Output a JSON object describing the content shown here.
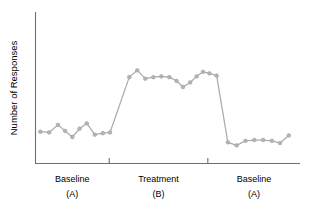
{
  "chart_data": {
    "type": "line",
    "title": "",
    "subtitle": "",
    "xlabel": "",
    "ylabel": "Number of Responses",
    "design": "ABA reversal (single-case) design",
    "grid": false,
    "legend": false,
    "legend_position": "none",
    "axis_ticks_shown": false,
    "xlim": [
      0,
      33
    ],
    "ylim": [
      0,
      10
    ],
    "colors": {
      "line": "#ababab",
      "marker": "#b3b3b3",
      "axis": "#6e6e6e",
      "text": "#000000",
      "background": "#ffffff"
    },
    "phases": [
      {
        "id": "A1",
        "label": "Baseline",
        "sublabel": "(A)",
        "x_start": 0,
        "x_end": 9.2,
        "n_points": 9
      },
      {
        "id": "B",
        "label": "Treatment",
        "sublabel": "(B)",
        "x_start": 9.2,
        "x_end": 21.5,
        "n_points": 15
      },
      {
        "id": "A2",
        "label": "Baseline",
        "sublabel": "(A)",
        "x_start": 21.5,
        "x_end": 33,
        "n_points": 8
      }
    ],
    "phase_dividers_x": [
      9.2,
      21.5
    ],
    "series": [
      {
        "name": "Responses",
        "x": [
          0.6,
          1.7,
          2.8,
          3.7,
          4.6,
          5.5,
          6.4,
          7.4,
          8.4,
          9.3,
          11.7,
          12.7,
          13.7,
          14.7,
          15.7,
          16.7,
          17.6,
          18.4,
          19.3,
          20.1,
          20.9,
          21.7,
          22.6,
          24.0,
          25.1,
          26.2,
          27.3,
          28.4,
          29.5,
          30.5,
          31.6
        ],
        "y": [
          2.1,
          2.05,
          2.55,
          2.15,
          1.75,
          2.3,
          2.65,
          1.9,
          2.0,
          2.05,
          5.7,
          6.15,
          5.6,
          5.7,
          5.75,
          5.7,
          5.45,
          5.05,
          5.35,
          5.75,
          6.05,
          5.95,
          5.8,
          1.4,
          1.2,
          1.5,
          1.55,
          1.55,
          1.5,
          1.35,
          1.85
        ]
      }
    ]
  }
}
